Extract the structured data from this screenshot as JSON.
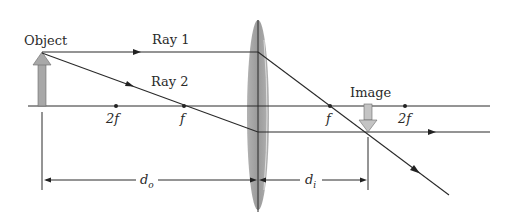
{
  "diagram": {
    "labels": {
      "object": "Object",
      "ray1": "Ray 1",
      "ray2": "Ray 2",
      "image": "Image",
      "two_f_left": "2f",
      "f_left": "f",
      "f_right": "f",
      "two_f_right": "2f",
      "d_o": "d",
      "d_o_sub": "o",
      "d_i": "d",
      "d_i_sub": "i"
    },
    "colors": {
      "line": "#2a2a2a",
      "lens": "#9a9a9a",
      "arrow_fill": "#a8a8a8",
      "image_arrow_fill": "#c4c4c4"
    }
  }
}
